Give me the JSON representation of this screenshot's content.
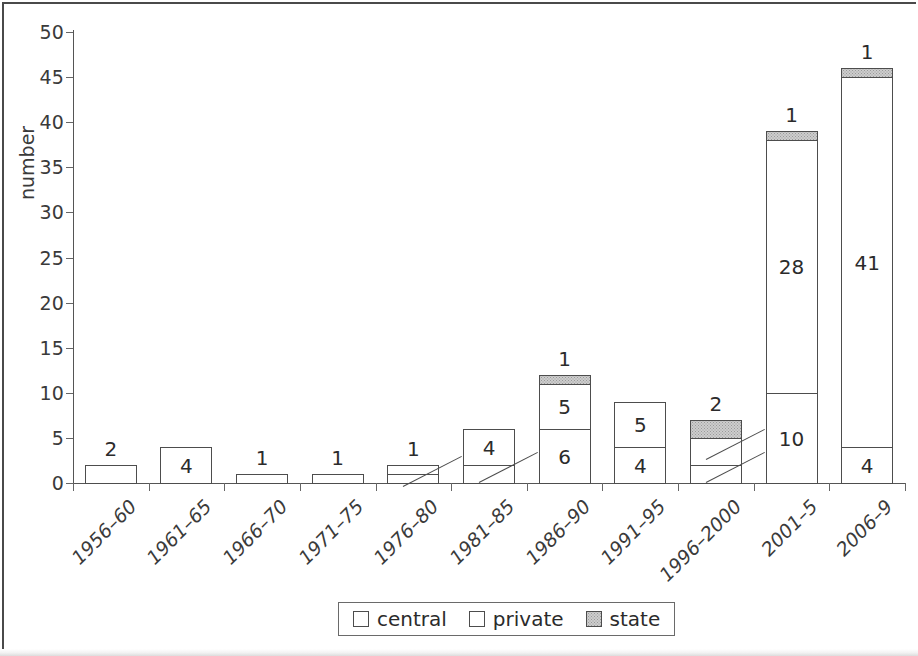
{
  "chart_data": {
    "type": "bar",
    "stacked": true,
    "title": "",
    "xlabel": "",
    "ylabel": "number",
    "ylim": [
      0,
      50
    ],
    "ytick_step": 5,
    "yticks": [
      0,
      5,
      10,
      15,
      20,
      25,
      30,
      35,
      40,
      45,
      50
    ],
    "grid": false,
    "legend_position": "bottom-center",
    "categories": [
      "1956–60",
      "1961–65",
      "1966–70",
      "1971–75",
      "1976–80",
      "1981–85",
      "1986–90",
      "1991–95",
      "1996–2000",
      "2001–5",
      "2006–9"
    ],
    "series": [
      {
        "name": "central",
        "color": "#ffffff",
        "values": [
          2,
          4,
          1,
          1,
          1,
          2,
          6,
          4,
          2,
          10,
          4
        ]
      },
      {
        "name": "private",
        "color": "#ffffff",
        "values": [
          0,
          0,
          0,
          0,
          1,
          4,
          5,
          5,
          3,
          28,
          41
        ]
      },
      {
        "name": "state",
        "color": "#cdcdcd",
        "values": [
          0,
          0,
          0,
          0,
          0,
          0,
          1,
          0,
          2,
          1,
          1
        ]
      }
    ],
    "totals": [
      2,
      4,
      1,
      1,
      2,
      6,
      12,
      9,
      7,
      39,
      46
    ]
  },
  "legend": {
    "items": [
      {
        "label": "central",
        "swatch": "white"
      },
      {
        "label": "private",
        "swatch": "white"
      },
      {
        "label": "state",
        "swatch": "gray-dotted"
      }
    ]
  },
  "annotations": {
    "bars": [
      {
        "index": 0,
        "total_label": "2",
        "inside": [
          {
            "seg": 0,
            "text": ""
          }
        ],
        "callouts": []
      },
      {
        "index": 1,
        "total_label": "",
        "inside": [
          {
            "seg": 0,
            "text": "4"
          }
        ],
        "callouts": []
      },
      {
        "index": 2,
        "total_label": "1",
        "inside": [
          {
            "seg": 0,
            "text": ""
          }
        ],
        "callouts": []
      },
      {
        "index": 3,
        "total_label": "1",
        "inside": [
          {
            "seg": 0,
            "text": ""
          }
        ],
        "callouts": []
      },
      {
        "index": 4,
        "total_label": "1",
        "inside": [
          {
            "seg": 0,
            "text": ""
          },
          {
            "seg": 1,
            "text": ""
          }
        ],
        "callouts": [
          {
            "text": "1",
            "seg": 0
          }
        ]
      },
      {
        "index": 5,
        "total_label": "",
        "inside": [
          {
            "seg": 0,
            "text": ""
          },
          {
            "seg": 1,
            "text": "4"
          }
        ],
        "callouts": [
          {
            "text": "2",
            "seg": 0
          }
        ]
      },
      {
        "index": 6,
        "total_label": "1",
        "inside": [
          {
            "seg": 0,
            "text": "6"
          },
          {
            "seg": 1,
            "text": "5"
          },
          {
            "seg": 2,
            "text": ""
          }
        ],
        "callouts": []
      },
      {
        "index": 7,
        "total_label": "",
        "inside": [
          {
            "seg": 0,
            "text": "4"
          },
          {
            "seg": 1,
            "text": "5"
          }
        ],
        "callouts": []
      },
      {
        "index": 8,
        "total_label": "2",
        "inside": [
          {
            "seg": 0,
            "text": ""
          },
          {
            "seg": 1,
            "text": ""
          },
          {
            "seg": 2,
            "text": ""
          }
        ],
        "callouts": [
          {
            "text": "3",
            "seg": 1
          },
          {
            "text": "2",
            "seg": 0
          }
        ]
      },
      {
        "index": 9,
        "total_label": "1",
        "inside": [
          {
            "seg": 0,
            "text": "10"
          },
          {
            "seg": 1,
            "text": "28"
          },
          {
            "seg": 2,
            "text": ""
          }
        ],
        "callouts": []
      },
      {
        "index": 10,
        "total_label": "1",
        "inside": [
          {
            "seg": 0,
            "text": "4"
          },
          {
            "seg": 1,
            "text": "41"
          },
          {
            "seg": 2,
            "text": ""
          }
        ],
        "callouts": []
      }
    ]
  },
  "colors": {
    "axis": "#555555",
    "bar_outline": "#4d4d4d",
    "state_fill": "#cdcdcd",
    "text": "#2b2b2b",
    "frame": "#4a4a4a"
  }
}
